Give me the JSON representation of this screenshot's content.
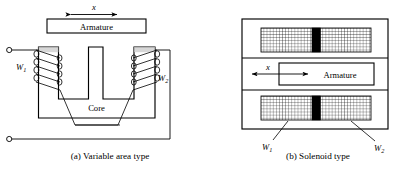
{
  "figure": {
    "panels": [
      {
        "id": "a",
        "caption": "(a) Variable area type",
        "armature_label": "Armature",
        "core_label": "Core",
        "displacement_label": "x",
        "coil_left_label": "W",
        "coil_left_sub": "1",
        "coil_right_label": "W",
        "coil_right_sub": "2",
        "terminal_count": 2,
        "coil_turns": 4
      },
      {
        "id": "b",
        "caption": "(b) Solenoid type",
        "armature_label": "Armature",
        "displacement_label": "x",
        "coil_left_label": "W",
        "coil_left_sub": "1",
        "coil_right_label": "W",
        "coil_right_sub": "2",
        "winding_blocks": 2
      }
    ]
  },
  "colors": {
    "stroke": "#000000",
    "background": "#ffffff",
    "fill_none": "none",
    "core_block": "#000000",
    "hatch": "#000000"
  }
}
